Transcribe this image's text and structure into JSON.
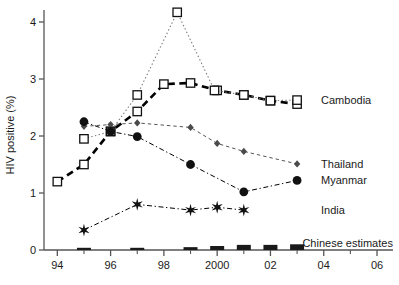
{
  "chart_data": {
    "type": "line",
    "title": "",
    "subtitle": "",
    "xlabel": "",
    "ylabel": "HIV positive (%)",
    "xlim": [
      1993.5,
      2006.6
    ],
    "ylim": [
      0,
      4.4
    ],
    "x_tick_labels": [
      "94",
      "96",
      "98",
      "2000",
      "02",
      "04",
      "06"
    ],
    "x_tick_values": [
      1994,
      1996,
      1998,
      2000,
      2002,
      2004,
      2006
    ],
    "x_minor_tick_values": [
      1995,
      1997,
      1999,
      2001,
      2003,
      2005
    ],
    "y_tick_labels": [
      "0",
      "1",
      "2",
      "3",
      "4"
    ],
    "y_tick_values": [
      0,
      1,
      2,
      3,
      4
    ],
    "grid": false,
    "legend_position": "right-inline",
    "series": [
      {
        "name": "Cambodia",
        "label": "Cambodia",
        "marker": "open-square",
        "line": "thick-dashed",
        "color": "#000000",
        "points": [
          {
            "x": 1994,
            "y": 1.2
          },
          {
            "x": 1995,
            "y": 1.5
          },
          {
            "x": 1996,
            "y": 2.08
          },
          {
            "x": 1997,
            "y": 2.43
          },
          {
            "x": 1998,
            "y": 2.91
          },
          {
            "x": 1999,
            "y": 2.93
          },
          {
            "x": 2000,
            "y": 2.8
          },
          {
            "x": 2001,
            "y": 2.72
          },
          {
            "x": 2002,
            "y": 2.62
          },
          {
            "x": 2003,
            "y": 2.56
          }
        ]
      },
      {
        "name": "Cambodia-upper",
        "label": "",
        "marker": "open-square",
        "line": "dotted",
        "color": "#7a7a7a",
        "points": [
          {
            "x": 1995,
            "y": 1.95
          },
          {
            "x": 1996,
            "y": 2.08
          },
          {
            "x": 1997,
            "y": 2.72
          },
          {
            "x": 1998.5,
            "y": 4.17
          },
          {
            "x": 1999.9,
            "y": 2.8
          },
          {
            "x": 2001,
            "y": 2.72
          },
          {
            "x": 2002,
            "y": 2.62
          },
          {
            "x": 2003,
            "y": 2.63
          }
        ]
      },
      {
        "name": "Thailand",
        "label": "Thailand",
        "marker": "diamond",
        "line": "dashed",
        "color": "#555555",
        "points": [
          {
            "x": 1995,
            "y": 2.17
          },
          {
            "x": 1996,
            "y": 2.2
          },
          {
            "x": 1997,
            "y": 2.23
          },
          {
            "x": 1999,
            "y": 2.15
          },
          {
            "x": 2000,
            "y": 1.87
          },
          {
            "x": 2001,
            "y": 1.73
          },
          {
            "x": 2003,
            "y": 1.51
          }
        ]
      },
      {
        "name": "Myanmar",
        "label": "Myanmar",
        "marker": "filled-circle",
        "line": "dash-dot",
        "color": "#000000",
        "points": [
          {
            "x": 1995,
            "y": 2.25
          },
          {
            "x": 1996,
            "y": 2.08
          },
          {
            "x": 1997,
            "y": 1.99
          },
          {
            "x": 1999,
            "y": 1.5
          },
          {
            "x": 2001,
            "y": 1.02
          },
          {
            "x": 2003,
            "y": 1.22
          }
        ]
      },
      {
        "name": "India",
        "label": "India",
        "marker": "star",
        "line": "dash-dot",
        "color": "#000000",
        "points": [
          {
            "x": 1995,
            "y": 0.35
          },
          {
            "x": 1997,
            "y": 0.8
          },
          {
            "x": 1999,
            "y": 0.7
          },
          {
            "x": 2000,
            "y": 0.75
          },
          {
            "x": 2001,
            "y": 0.7
          }
        ]
      },
      {
        "name": "Chinese estimates",
        "label": "Chinese estimates",
        "marker": "bar",
        "line": "none",
        "color": "#1a1a1a",
        "points": [
          {
            "x": 1995,
            "y": 0.012
          },
          {
            "x": 1997,
            "y": 0.03
          },
          {
            "x": 1999,
            "y": 0.05
          },
          {
            "x": 2000,
            "y": 0.07
          },
          {
            "x": 2001,
            "y": 0.09
          },
          {
            "x": 2002,
            "y": 0.09
          },
          {
            "x": 2003,
            "y": 0.1
          }
        ]
      }
    ],
    "annotations": [
      {
        "name": "label-cambodia",
        "text": "Cambodia",
        "x": 2003.9,
        "y": 2.63
      },
      {
        "name": "label-thailand",
        "text": "Thailand",
        "x": 2003.9,
        "y": 1.51
      },
      {
        "name": "label-myanmar",
        "text": "Myanmar",
        "x": 2003.9,
        "y": 1.22
      },
      {
        "name": "label-india",
        "text": "India",
        "x": 2003.9,
        "y": 0.7
      },
      {
        "name": "label-chinese",
        "text": "Chinese estimates",
        "x": 2003.2,
        "y": 0.13
      }
    ]
  },
  "axes": {
    "y_title": "HIV positive (%)"
  }
}
